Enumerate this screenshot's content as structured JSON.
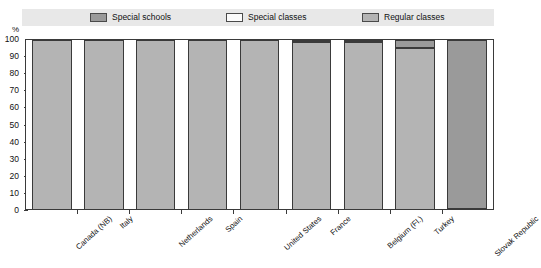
{
  "legend": {
    "items": [
      {
        "label": "Special schools",
        "color": "#9a9a9a"
      },
      {
        "label": "Special classes",
        "color": "#fbfbfb"
      },
      {
        "label": "Regular classes",
        "color": "#b4b4b4"
      }
    ]
  },
  "axis": {
    "y_unit": "%",
    "y_ticks": [
      "100",
      "90",
      "80",
      "70",
      "60",
      "50",
      "40",
      "30",
      "20",
      "10",
      "0"
    ]
  },
  "chart_data": {
    "type": "bar",
    "title": "",
    "subtitle": "",
    "xlabel": "",
    "ylabel": "%",
    "ylim": [
      0,
      100
    ],
    "stacked": true,
    "stack_total": 100,
    "grid": false,
    "legend_position": "top",
    "categories": [
      "Canada (NB)",
      "Italy",
      "Netherlands",
      "Spain",
      "United States",
      "France",
      "Belgium (Fl.)",
      "Turkey",
      "Slovak Republic"
    ],
    "series": [
      {
        "name": "Special schools",
        "color": "#9a9a9a",
        "values": [
          0,
          0,
          0,
          0,
          0,
          1,
          1,
          5,
          100
        ]
      },
      {
        "name": "Special classes",
        "color": "#fbfbfb",
        "values": [
          0,
          0,
          0,
          0,
          0,
          0,
          0,
          0,
          0
        ]
      },
      {
        "name": "Regular classes",
        "color": "#b4b4b4",
        "values": [
          100,
          100,
          100,
          100,
          100,
          99,
          99,
          95,
          0
        ]
      }
    ]
  }
}
